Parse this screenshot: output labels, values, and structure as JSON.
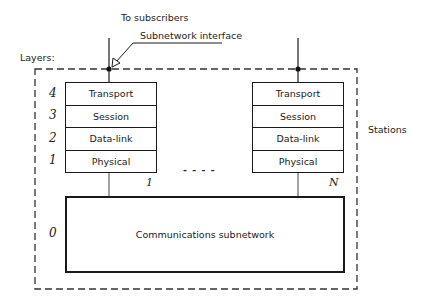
{
  "labels": {
    "to_subscribers": "To subscribers",
    "subnetwork_interface": "Subnetwork interface",
    "layers": "Layers:",
    "stations": "Stations",
    "ellipsis": "- - - -"
  },
  "layer_numbers": [
    "4",
    "3",
    "2",
    "1",
    "0"
  ],
  "stations": [
    {
      "index_label": "1",
      "layers": [
        "Transport",
        "Session",
        "Data-link",
        "Physical"
      ]
    },
    {
      "index_label": "N",
      "layers": [
        "Transport",
        "Session",
        "Data-link",
        "Physical"
      ]
    }
  ],
  "subnetwork": {
    "label": "Communications subnetwork"
  }
}
